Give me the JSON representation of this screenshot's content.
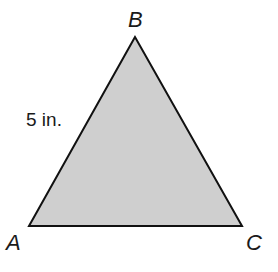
{
  "diagram": {
    "shape": "triangle",
    "fill_color": "#cfcfcf",
    "stroke_color": "#111111",
    "vertices": [
      {
        "label": "A"
      },
      {
        "label": "B"
      },
      {
        "label": "C"
      }
    ],
    "side_labels": [
      {
        "side": "AB",
        "text": "5 in."
      }
    ]
  }
}
